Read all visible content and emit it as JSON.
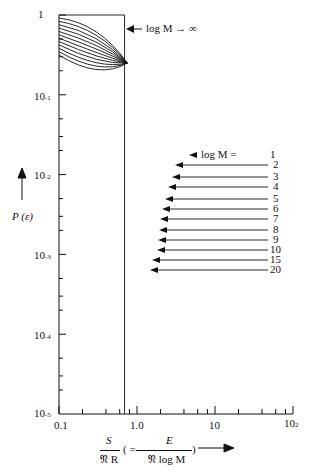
{
  "chart_data": {
    "type": "line",
    "title": "",
    "xscale": "log",
    "yscale": "log",
    "xlim": [
      0.1,
      100
    ],
    "ylim": [
      1e-05,
      1
    ],
    "xlabel": "S / (𝔑 R) ( = E / (𝔑 log M) )",
    "xlabel_parts": {
      "num_left": "S",
      "den_left": "𝔑 R",
      "paren_open": "( =",
      "num_right": "E",
      "den_right": "𝔑 log M",
      "paren_close": ")"
    },
    "ylabel": "P (ε)",
    "x_ticks": [
      "0.1",
      "1.0",
      "10",
      "10²"
    ],
    "y_ticks": [
      "1",
      "10⁻¹",
      "10⁻²",
      "10⁻³",
      "10⁻⁴",
      "10⁻⁵"
    ],
    "grid": false,
    "series": [
      {
        "name": "log M → ∞",
        "shape": "step",
        "points": [
          [
            0.1,
            1.0
          ],
          [
            0.693,
            1.0
          ],
          [
            0.693,
            1e-05
          ]
        ]
      },
      {
        "name": "log M = 1",
        "x_at_1e-5": 18.5
      },
      {
        "name": "log M = 2",
        "x_at_1e-5": 9.8
      },
      {
        "name": "log M = 3",
        "x_at_1e-5": 7.0
      },
      {
        "name": "log M = 4",
        "x_at_1e-5": 5.7
      },
      {
        "name": "log M = 5",
        "x_at_1e-5": 4.9
      },
      {
        "name": "log M = 6",
        "x_at_1e-5": 4.4
      },
      {
        "name": "log M = 7",
        "x_at_1e-5": 4.0
      },
      {
        "name": "log M = 8",
        "x_at_1e-5": 3.7
      },
      {
        "name": "log M = 9",
        "x_at_1e-5": 3.5
      },
      {
        "name": "log M = 10",
        "x_at_1e-5": 3.3
      },
      {
        "name": "log M = 15",
        "x_at_1e-5": 2.8
      },
      {
        "name": "log M = 20",
        "x_at_1e-5": 2.5
      }
    ],
    "crossover_point": {
      "x": 0.75,
      "y": 0.25
    },
    "annotations": {
      "infinity_label": "log M → ∞",
      "legend_prefix": "log M =",
      "legend_values": [
        "1",
        "2",
        "3",
        "4",
        "5",
        "6",
        "7",
        "8",
        "9",
        "10",
        "15",
        "20"
      ]
    }
  }
}
